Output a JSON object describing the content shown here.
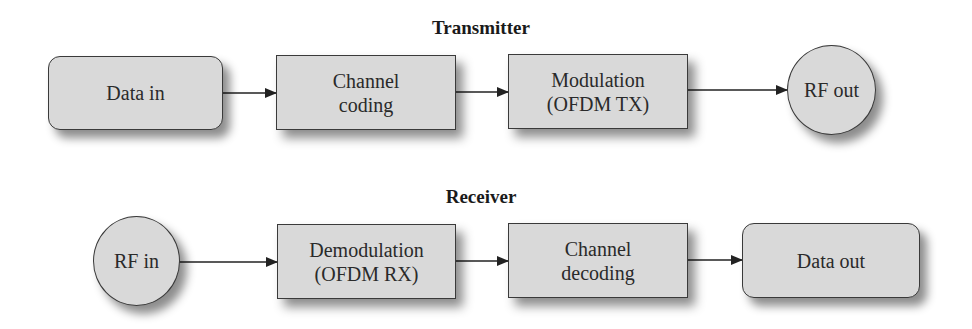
{
  "transmitter": {
    "title": "Transmitter",
    "nodes": [
      {
        "id": "data-in",
        "label": "Data in",
        "shape": "rounded"
      },
      {
        "id": "channel-coding",
        "label": "Channel\ncoding",
        "shape": "rect"
      },
      {
        "id": "modulation",
        "label": "Modulation\n(OFDM TX)",
        "shape": "rect"
      },
      {
        "id": "rf-out",
        "label": "RF out",
        "shape": "circle"
      }
    ]
  },
  "receiver": {
    "title": "Receiver",
    "nodes": [
      {
        "id": "rf-in",
        "label": "RF in",
        "shape": "circle"
      },
      {
        "id": "demodulation",
        "label": "Demodulation\n(OFDM RX)",
        "shape": "rect"
      },
      {
        "id": "channel-decoding",
        "label": "Channel\ndecoding",
        "shape": "rect"
      },
      {
        "id": "data-out",
        "label": "Data out",
        "shape": "rounded"
      }
    ]
  },
  "edges": [
    {
      "from": "data-in",
      "to": "channel-coding"
    },
    {
      "from": "channel-coding",
      "to": "modulation"
    },
    {
      "from": "modulation",
      "to": "rf-out"
    },
    {
      "from": "rf-in",
      "to": "demodulation"
    },
    {
      "from": "demodulation",
      "to": "channel-decoding"
    },
    {
      "from": "channel-decoding",
      "to": "data-out"
    }
  ],
  "colors": {
    "node_fill": "#d9d9d9",
    "node_border": "#3a3a3a",
    "text": "#2a2a2a",
    "arrow": "#222222"
  }
}
